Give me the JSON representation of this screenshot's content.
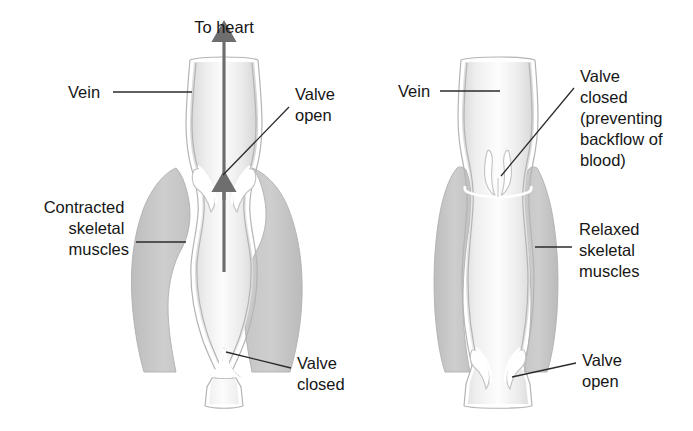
{
  "figure": {
    "width": 693,
    "height": 431,
    "background": "#ffffff"
  },
  "colors": {
    "muscle_fill": "#c9c9c9",
    "muscle_edge": "#b0b0b0",
    "vein_lumen_light": "#fbfbfb",
    "vein_lumen_shade": "#dcdcdc",
    "vein_outline": "#b4b4b4",
    "arrow": "#6e6e6e",
    "text": "#161616",
    "leader_line": "#2b2b2b"
  },
  "panels": [
    {
      "id": "left",
      "name": "contracted-muscle-panel",
      "state": "Contracted",
      "top_label": "To heart",
      "labels": [
        {
          "name": "vein-label",
          "text": "Vein",
          "lines": [
            "Vein"
          ],
          "x": 36,
          "y": 98,
          "align": "start"
        },
        {
          "name": "valve-open-label",
          "text": "Valve open",
          "lines": [
            "Valve",
            "open"
          ],
          "x": 295,
          "y": 100,
          "align": "start"
        },
        {
          "name": "contracted-muscle-label",
          "text": "Contracted skeletal muscles",
          "lines": [
            "Contracted",
            "skeletal",
            "muscles"
          ],
          "x": 129,
          "y": 213,
          "align": "end"
        },
        {
          "name": "valve-closed-label",
          "text": "Valve closed",
          "lines": [
            "Valve",
            "closed"
          ],
          "x": 297,
          "y": 369,
          "align": "start"
        }
      ],
      "flow_arrows": 2,
      "flow_direction": "upward-to-heart",
      "valves": [
        {
          "name": "upper-valve",
          "state": "open",
          "position": "upper"
        },
        {
          "name": "lower-valve",
          "state": "closed",
          "position": "lower"
        }
      ]
    },
    {
      "id": "right",
      "name": "relaxed-muscle-panel",
      "state": "Relaxed",
      "top_label": "",
      "labels": [
        {
          "name": "vein-label",
          "text": "Vein",
          "lines": [
            "Vein"
          ],
          "x": 398,
          "y": 97,
          "align": "start"
        },
        {
          "name": "valve-closed-label",
          "text": "Valve closed (preventing backflow of blood)",
          "lines": [
            "Valve",
            "closed",
            "(preventing",
            "backflow of",
            "blood)"
          ],
          "x": 580,
          "y": 82,
          "align": "start"
        },
        {
          "name": "relaxed-muscle-label",
          "text": "Relaxed skeletal muscles",
          "lines": [
            "Relaxed",
            "skeletal",
            "muscles"
          ],
          "x": 579,
          "y": 235,
          "align": "start"
        },
        {
          "name": "valve-open-label",
          "text": "Valve open",
          "lines": [
            "Valve",
            "open"
          ],
          "x": 582,
          "y": 366,
          "align": "start"
        }
      ],
      "flow_arrows": 0,
      "flow_direction": "none",
      "valves": [
        {
          "name": "upper-valve",
          "state": "closed",
          "position": "upper"
        },
        {
          "name": "lower-valve",
          "state": "open",
          "position": "lower"
        }
      ]
    }
  ]
}
